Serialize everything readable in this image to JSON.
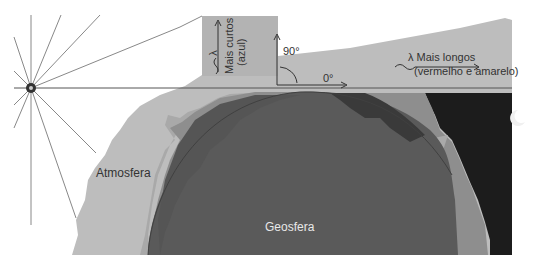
{
  "diagram": {
    "labels": {
      "atmosphere": "Atmosfera",
      "geosphere": "Geosfera",
      "short_wavelength_line1": "Mais curtos",
      "short_wavelength_line2": "(azul)",
      "short_lambda": "λ",
      "long_wavelength_line1": "λ Mais longos",
      "long_wavelength_line2": "(vermelho e amarelo)",
      "angle_90": "90°",
      "angle_0": "0°"
    },
    "icons": {
      "sun": "sun-icon",
      "moon": "crescent-moon-icon"
    },
    "colors": {
      "background": "#ffffff",
      "atmosphere": "#bdbdbd",
      "atmosphere_upper": "#b5b5b5",
      "night_sky": "#1c1c1c",
      "geosphere": "#5a5a5a",
      "land_mid": "#8a8a8a",
      "land_light": "#a8a8a8",
      "land_dark": "#3a3a3a",
      "rays": "#888888",
      "text": "#333333"
    }
  }
}
